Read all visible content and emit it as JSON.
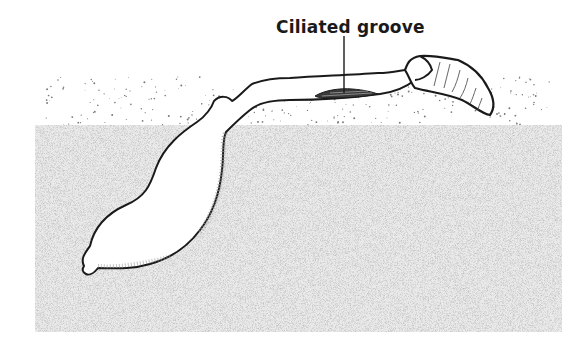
{
  "figure": {
    "label": "Ciliated groove",
    "colors": {
      "ink": "#1a1a1a",
      "stipple": "#7a7a7a",
      "background": "#ffffff"
    }
  }
}
